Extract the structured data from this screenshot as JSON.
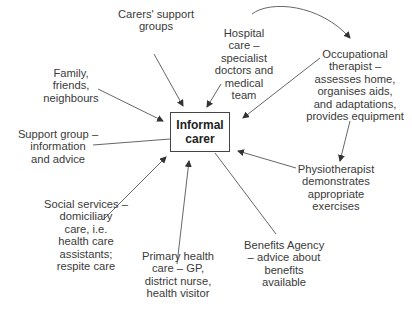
{
  "center": {
    "lines": [
      "Informal",
      "carer"
    ]
  },
  "nodes": {
    "carers_support": {
      "lines": [
        "Carers' support",
        "groups"
      ]
    },
    "hospital": {
      "lines": [
        "Hospital",
        "care –",
        "specialist",
        "doctors and",
        "medical",
        "team"
      ]
    },
    "family": {
      "lines": [
        "Family,",
        "friends,",
        "neighbours"
      ]
    },
    "support_group": {
      "lines": [
        "Support group –",
        "information",
        "and advice"
      ]
    },
    "social_services": {
      "lines": [
        "Social services –",
        "domiciliary",
        "care, i.e.",
        "health care",
        "assistants;",
        "respite care"
      ]
    },
    "primary_health": {
      "lines": [
        "Primary health",
        "care – GP,",
        "district nurse,",
        "health visitor"
      ]
    },
    "benefits": {
      "lines": [
        "Benefits Agency",
        "– advice about",
        "benefits",
        "available"
      ]
    },
    "physio": {
      "lines": [
        "Physiotherapist",
        "demonstrates",
        "appropriate",
        "exercises"
      ]
    },
    "ot": {
      "lines": [
        "Occupational",
        "therapist –",
        "assesses home,",
        "organises aids,",
        "and adaptations,",
        "provides equipment"
      ]
    }
  },
  "colors": {
    "line": "#444444",
    "text": "#3a3a3a"
  }
}
